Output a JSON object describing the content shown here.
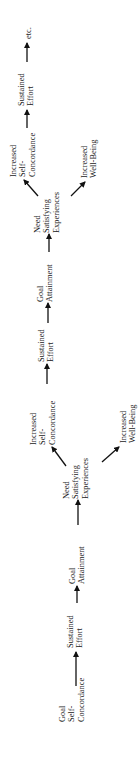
{
  "diagram": {
    "orientation": "rotated -90deg (reads bottom to top)",
    "nodes": {
      "goal_self_concordance": {
        "lines": [
          "Goal",
          "Self-",
          "Concordance"
        ]
      },
      "sustained_effort_1": {
        "lines": [
          "Sustained",
          "Effort"
        ]
      },
      "goal_attainment_1": {
        "lines": [
          "Goal",
          "Attainment"
        ]
      },
      "need_satisfying_1": {
        "lines": [
          "Need",
          "Satisfying",
          "Experiences"
        ]
      },
      "increased_self_concordance_1": {
        "lines": [
          "Increased",
          "Self-",
          "Concordance"
        ]
      },
      "increased_well_being_1": {
        "lines": [
          "Increased",
          "Well-Being"
        ]
      },
      "sustained_effort_2": {
        "lines": [
          "Sustained",
          "Effort"
        ]
      },
      "goal_attainment_2": {
        "lines": [
          "Goal",
          "Attainment"
        ]
      },
      "need_satisfying_2": {
        "lines": [
          "Need",
          "Satisfying",
          "Experiences"
        ]
      },
      "increased_self_concordance_2": {
        "lines": [
          "Increased",
          "Self-",
          "Concordance"
        ]
      },
      "increased_well_being_2": {
        "lines": [
          "Increased",
          "Well-Being"
        ]
      },
      "sustained_effort_3": {
        "lines": [
          "Sustained",
          "Effort"
        ]
      },
      "etc": {
        "lines": [
          "etc."
        ]
      }
    },
    "edges": [
      [
        "goal_self_concordance",
        "sustained_effort_1"
      ],
      [
        "sustained_effort_1",
        "goal_attainment_1"
      ],
      [
        "goal_attainment_1",
        "need_satisfying_1"
      ],
      [
        "need_satisfying_1",
        "increased_self_concordance_1"
      ],
      [
        "need_satisfying_1",
        "increased_well_being_1"
      ],
      [
        "increased_self_concordance_1",
        "sustained_effort_2"
      ],
      [
        "sustained_effort_2",
        "goal_attainment_2"
      ],
      [
        "goal_attainment_2",
        "need_satisfying_2"
      ],
      [
        "need_satisfying_2",
        "increased_self_concordance_2"
      ],
      [
        "need_satisfying_2",
        "increased_well_being_2"
      ],
      [
        "increased_self_concordance_2",
        "sustained_effort_3"
      ],
      [
        "sustained_effort_3",
        "etc"
      ]
    ],
    "colors": {
      "text": "#1a1a1a",
      "arrow": "#111111",
      "background": "#ffffff"
    }
  }
}
